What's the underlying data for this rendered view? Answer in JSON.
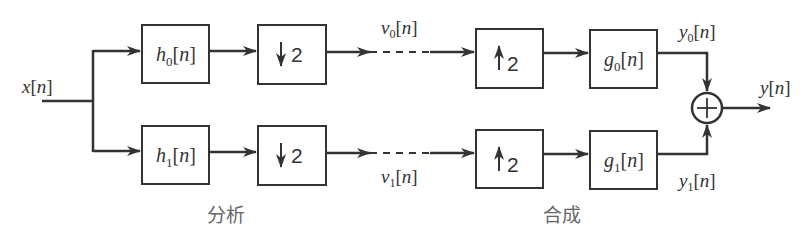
{
  "diagram": {
    "type": "two-channel filter bank",
    "input": {
      "name": "x",
      "arg": "n"
    },
    "output": {
      "name": "y",
      "arg": "n"
    },
    "sections": {
      "analysis": "分析",
      "synthesis": "合成"
    },
    "branches": [
      {
        "analysis_filter": {
          "name": "h",
          "sub": "0",
          "arg": "n"
        },
        "downsampler": {
          "arrow": "↓",
          "factor": "2"
        },
        "channel_signal": {
          "name": "v",
          "sub": "0",
          "arg": "n"
        },
        "upsampler": {
          "arrow": "↑",
          "factor": "2"
        },
        "synthesis_filter": {
          "name": "g",
          "sub": "0",
          "arg": "n"
        },
        "branch_output": {
          "name": "y",
          "sub": "0",
          "arg": "n"
        }
      },
      {
        "analysis_filter": {
          "name": "h",
          "sub": "1",
          "arg": "n"
        },
        "downsampler": {
          "arrow": "↓",
          "factor": "2"
        },
        "channel_signal": {
          "name": "v",
          "sub": "1",
          "arg": "n"
        },
        "upsampler": {
          "arrow": "↑",
          "factor": "2"
        },
        "synthesis_filter": {
          "name": "g",
          "sub": "1",
          "arg": "n"
        },
        "branch_output": {
          "name": "y",
          "sub": "1",
          "arg": "n"
        }
      }
    ],
    "adder": {
      "symbol": "+"
    },
    "colors": {
      "stroke": "#333333",
      "caption": "#666666",
      "background": "#ffffff"
    }
  }
}
